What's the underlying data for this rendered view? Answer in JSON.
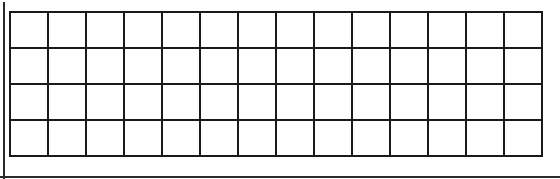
{
  "grid": {
    "rows": 4,
    "columns": 14,
    "line_color": "#1a1a1a",
    "cell_color": "#ffffff",
    "cells": [
      [
        "",
        "",
        "",
        "",
        "",
        "",
        "",
        "",
        "",
        "",
        "",
        "",
        "",
        ""
      ],
      [
        "",
        "",
        "",
        "",
        "",
        "",
        "",
        "",
        "",
        "",
        "",
        "",
        "",
        ""
      ],
      [
        "",
        "",
        "",
        "",
        "",
        "",
        "",
        "",
        "",
        "",
        "",
        "",
        "",
        ""
      ],
      [
        "",
        "",
        "",
        "",
        "",
        "",
        "",
        "",
        "",
        "",
        "",
        "",
        "",
        ""
      ]
    ]
  }
}
